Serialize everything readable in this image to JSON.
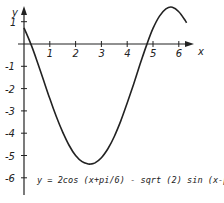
{
  "chart_data": {
    "type": "line",
    "title": "",
    "xlabel": "x",
    "ylabel": "y",
    "xlim": [
      0,
      6.5
    ],
    "ylim": [
      -7,
      1.5
    ],
    "x_ticks": [
      1,
      2,
      3,
      4,
      5,
      6
    ],
    "y_ticks": [
      1,
      -1,
      -2,
      -3,
      -4,
      -5,
      -6
    ],
    "grid": false,
    "annotation": "y = 2cos (x+pi/6) - sqrt (2) sin (x-pi/2)-2",
    "series": [
      {
        "name": "y = 2cos (x+pi/6) - sqrt (2) sin (x-pi/2)-2",
        "x": [
          0,
          0.25,
          0.5,
          0.75,
          1,
          1.25,
          1.5,
          1.75,
          2,
          2.25,
          2.5,
          2.6,
          2.75,
          3,
          3.25,
          3.5,
          3.75,
          4,
          4.25,
          4.5,
          4.75,
          5,
          5.25,
          5.5,
          5.75,
          6,
          6.25,
          6.3
        ],
        "y": [
          0.72,
          0.05,
          -0.75,
          -1.6,
          -2.45,
          -3.25,
          -3.95,
          -4.55,
          -5.0,
          -5.28,
          -5.38,
          -5.38,
          -5.33,
          -5.1,
          -4.7,
          -4.15,
          -3.45,
          -2.65,
          -1.8,
          -0.9,
          -0.05,
          0.7,
          1.25,
          1.58,
          1.65,
          1.45,
          1.05,
          0.95
        ]
      }
    ]
  },
  "labels": {
    "x_axis": "x",
    "y_axis": "y",
    "formula": "y = 2cos (x+pi/6) - sqrt (2) sin (x-pi/2)-2"
  }
}
